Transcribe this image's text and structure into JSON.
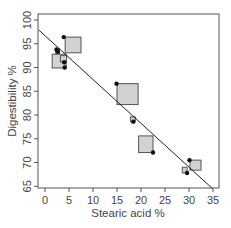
{
  "chart_data": {
    "type": "scatter",
    "title": "",
    "xlabel": "Stearic acid %",
    "ylabel": "Digestibility %",
    "xlim": [
      -1.5,
      36.5
    ],
    "ylim": [
      64,
      101
    ],
    "xticks": [
      0,
      5,
      10,
      15,
      20,
      25,
      30,
      35
    ],
    "yticks": [
      65,
      70,
      75,
      80,
      85,
      90,
      95,
      100
    ],
    "grid": false,
    "legend": null,
    "series": [
      {
        "name": "observed",
        "marker": "filled-circle",
        "color": "#111111",
        "points": [
          {
            "x": 3.9,
            "y": 96.4
          },
          {
            "x": 2.7,
            "y": 93.3
          },
          {
            "x": 2.4,
            "y": 93.8
          },
          {
            "x": 4.0,
            "y": 91.1
          },
          {
            "x": 4.1,
            "y": 90.0
          },
          {
            "x": 14.9,
            "y": 86.6
          },
          {
            "x": 18.4,
            "y": 78.6
          },
          {
            "x": 22.5,
            "y": 72.1
          },
          {
            "x": 30.1,
            "y": 70.5
          },
          {
            "x": 29.6,
            "y": 67.8
          }
        ]
      },
      {
        "name": "predicted",
        "marker": "grey-square",
        "color": "#d2d2d2",
        "note": "square size varies",
        "squares": [
          {
            "x0": 4.2,
            "y0": 93.1,
            "x1": 7.5,
            "y1": 96.4
          },
          {
            "x0": 1.5,
            "y0": 89.9,
            "x1": 4.4,
            "y1": 92.8
          },
          {
            "x0": 2.2,
            "y0": 93.0,
            "x1": 3.0,
            "y1": 94.0
          },
          {
            "x0": 3.2,
            "y0": 91.2,
            "x1": 4.5,
            "y1": 92.5
          },
          {
            "x0": 15.0,
            "y0": 82.2,
            "x1": 19.4,
            "y1": 86.6
          },
          {
            "x0": 17.8,
            "y0": 78.6,
            "x1": 18.8,
            "y1": 79.6
          },
          {
            "x0": 19.5,
            "y0": 72.1,
            "x1": 22.5,
            "y1": 75.6
          },
          {
            "x0": 30.2,
            "y0": 68.4,
            "x1": 32.5,
            "y1": 70.5
          },
          {
            "x0": 28.6,
            "y0": 67.8,
            "x1": 29.6,
            "y1": 69.0
          }
        ]
      },
      {
        "name": "regression line",
        "type": "line",
        "color": "#222222",
        "points": [
          {
            "x": -1.3,
            "y": 97.9
          },
          {
            "x": 34.9,
            "y": 64.5
          }
        ]
      }
    ]
  }
}
